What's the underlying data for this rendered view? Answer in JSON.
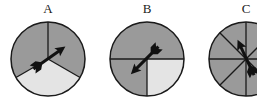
{
  "colors": {
    "dark": "#9a9a9a",
    "light": "#e4e4e4",
    "stroke": "#1a1a1a"
  },
  "spinners": [
    {
      "label": "A",
      "sectors": 3,
      "light_sector": "bottom third",
      "arrow": "points toward upper-right"
    },
    {
      "label": "B",
      "sectors": 4,
      "light_sector": "lower-right quarter (halves: top half dark, lower-left quarter dark)",
      "arrow": "points toward lower-left"
    },
    {
      "label": "C",
      "sectors": 8,
      "light_sector": "none (all dark)",
      "arrow": "points toward upper-left"
    }
  ]
}
